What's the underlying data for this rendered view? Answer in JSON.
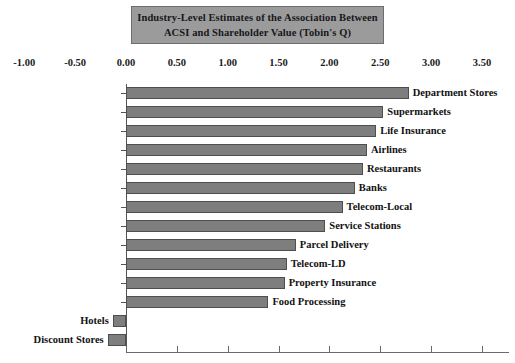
{
  "title": {
    "line1": "Industry-Level Estimates of the Association Between",
    "line2": "ACSI and Shareholder Value (Tobin's Q)",
    "background_color": "#9b9b9b",
    "border_color": "#6e6e6e"
  },
  "colors": {
    "bar_fill": "#7e7e7e",
    "bar_border": "#4e4e4e",
    "axis": "#555555",
    "text": "#121212",
    "background": "#ffffff"
  },
  "axis": {
    "tick_labels": [
      "-1.00",
      "-0.50",
      "0.00",
      "0.50",
      "1.00",
      "1.50",
      "2.00",
      "2.50",
      "3.00",
      "3.50"
    ],
    "tick_values": [
      -1.0,
      -0.5,
      0.0,
      0.5,
      1.0,
      1.5,
      2.0,
      2.5,
      3.0,
      3.5
    ],
    "min": -1.0,
    "max": 3.5,
    "step": 0.5
  },
  "chart_data": {
    "type": "bar",
    "orientation": "horizontal",
    "title": "Industry-Level Estimates of the Association Between ACSI and Shareholder Value (Tobin's Q)",
    "xlabel": "",
    "ylabel": "",
    "xlim": [
      -1.0,
      3.5
    ],
    "grid": false,
    "legend": "none",
    "categories": [
      "Department Stores",
      "Supermarkets",
      "Life Insurance",
      "Airlines",
      "Restaurants",
      "Banks",
      "Telecom-Local",
      "Service Stations",
      "Parcel Delivery",
      "Telecom-LD",
      "Property Insurance",
      "Food Processing",
      "Hotels",
      "Discount Stores"
    ],
    "values": [
      2.78,
      2.53,
      2.46,
      2.37,
      2.33,
      2.25,
      2.13,
      1.96,
      1.67,
      1.58,
      1.56,
      1.4,
      -0.13,
      -0.18
    ]
  }
}
